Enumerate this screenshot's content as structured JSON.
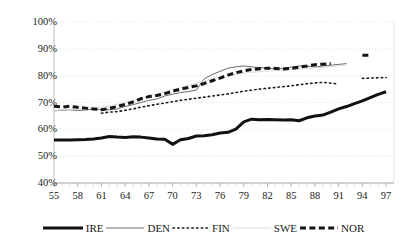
{
  "chart_data": {
    "type": "line",
    "title": "",
    "subtitle": "",
    "xlabel": "",
    "ylabel": "",
    "xlim": [
      1955,
      1998
    ],
    "ylim": [
      40,
      100
    ],
    "y_tick_format": "percent",
    "grid": true,
    "grid_style": "dotted-light-horizontal",
    "legend_position": "bottom",
    "x": [
      1955,
      1956,
      1957,
      1958,
      1959,
      1960,
      1961,
      1962,
      1963,
      1964,
      1965,
      1966,
      1967,
      1968,
      1969,
      1970,
      1971,
      1972,
      1973,
      1974,
      1975,
      1976,
      1977,
      1978,
      1979,
      1980,
      1981,
      1982,
      1983,
      1984,
      1985,
      1986,
      1987,
      1988,
      1989,
      1990,
      1991,
      1992,
      1993,
      1994,
      1995,
      1996,
      1997
    ],
    "y_ticks": [
      40,
      50,
      60,
      70,
      80,
      90,
      100
    ],
    "y_tick_labels": [
      "40%",
      "50%",
      "60%",
      "70%",
      "80%",
      "90%",
      "100%"
    ],
    "x_ticks": [
      1955,
      1958,
      1961,
      1964,
      1967,
      1970,
      1973,
      1976,
      1979,
      1982,
      1985,
      1988,
      1991,
      1994,
      1997
    ],
    "x_tick_labels": [
      "55",
      "58",
      "61",
      "64",
      "67",
      "70",
      "73",
      "76",
      "79",
      "82",
      "85",
      "88",
      "91",
      "94",
      "97"
    ],
    "series": [
      {
        "name": "IRE",
        "style": "solid-thick",
        "color": "#111111",
        "width": 3.0,
        "values": [
          56.0,
          56.0,
          56.0,
          56.1,
          56.2,
          56.4,
          56.8,
          57.3,
          57.1,
          57.0,
          57.2,
          57.1,
          56.8,
          56.4,
          56.3,
          54.4,
          56.1,
          56.6,
          57.5,
          57.6,
          58.0,
          58.6,
          58.9,
          60.1,
          62.8,
          63.8,
          63.6,
          63.7,
          63.6,
          63.5,
          63.6,
          63.2,
          64.3,
          65.0,
          65.3,
          66.4,
          67.6,
          68.5,
          69.6,
          70.6,
          71.8,
          73.0,
          74.0
        ],
        "values_null_ranges": []
      },
      {
        "name": "DEN",
        "style": "solid-thin",
        "color": "#6b6b6b",
        "width": 1.0,
        "values": [
          66.9,
          67.1,
          67.3,
          67.0,
          67.2,
          67.5,
          67.4,
          67.3,
          67.6,
          68.5,
          69.2,
          70.0,
          70.8,
          71.3,
          72.4,
          73.1,
          73.7,
          74.1,
          74.6,
          78.8,
          80.4,
          81.6,
          82.8,
          83.3,
          83.6,
          83.3,
          83.0,
          82.8,
          82.5,
          82.8,
          83.2,
          83.6,
          83.5,
          83.2,
          83.6,
          83.9,
          84.2,
          84.5,
          null,
          null,
          null,
          null,
          null
        ]
      },
      {
        "name": "FIN",
        "style": "dotted",
        "color": "#1c1c1c",
        "width": 1.6,
        "values": [
          null,
          null,
          null,
          null,
          null,
          null,
          66.0,
          66.4,
          66.6,
          67.1,
          67.6,
          68.3,
          68.8,
          69.3,
          69.8,
          70.3,
          70.8,
          71.2,
          71.6,
          72.0,
          72.4,
          72.8,
          73.2,
          73.7,
          74.2,
          74.6,
          75.0,
          75.3,
          75.6,
          75.9,
          76.2,
          76.6,
          77.0,
          77.3,
          77.5,
          77.2,
          76.9,
          null,
          null,
          79.0,
          79.1,
          79.2,
          79.3
        ]
      },
      {
        "name": "SWE",
        "style": "solid-very-light",
        "color": "#d8d8d8",
        "width": 0.9,
        "values": [
          67.0,
          67.2,
          67.4,
          67.6,
          67.8,
          68.0,
          68.3,
          68.7,
          69.3,
          70.0,
          70.8,
          71.6,
          72.4,
          73.2,
          74.0,
          74.8,
          75.6,
          76.4,
          77.2,
          78.0,
          78.8,
          79.4,
          80.0,
          80.5,
          80.9,
          81.2,
          81.5,
          81.7,
          81.9,
          82.1,
          82.3,
          82.5,
          82.7,
          82.9,
          83.1,
          83.4,
          83.7,
          84.0,
          null,
          null,
          null,
          null,
          null
        ]
      },
      {
        "name": "NOR",
        "style": "dashed-thick",
        "color": "#141414",
        "width": 3.0,
        "values": [
          68.6,
          68.3,
          68.6,
          68.2,
          67.9,
          67.6,
          67.3,
          67.8,
          68.5,
          69.3,
          70.2,
          71.4,
          72.2,
          72.6,
          73.3,
          74.2,
          75.0,
          75.6,
          76.2,
          77.1,
          78.1,
          79.1,
          80.2,
          81.1,
          81.8,
          82.3,
          82.6,
          82.8,
          82.7,
          82.5,
          82.7,
          83.2,
          83.6,
          84.1,
          84.3,
          84.5,
          null,
          null,
          null,
          87.6,
          87.6,
          null,
          null
        ]
      }
    ],
    "legend": [
      {
        "label": "IRE",
        "style": "solid-thick",
        "color": "#111111"
      },
      {
        "label": "DEN",
        "style": "solid-thin",
        "color": "#6b6b6b"
      },
      {
        "label": "FIN",
        "style": "dotted",
        "color": "#1c1c1c"
      },
      {
        "label": "SWE",
        "style": "solid-very-light",
        "color": "#d8d8d8"
      },
      {
        "label": "NOR",
        "style": "dashed-thick",
        "color": "#141414"
      }
    ]
  }
}
